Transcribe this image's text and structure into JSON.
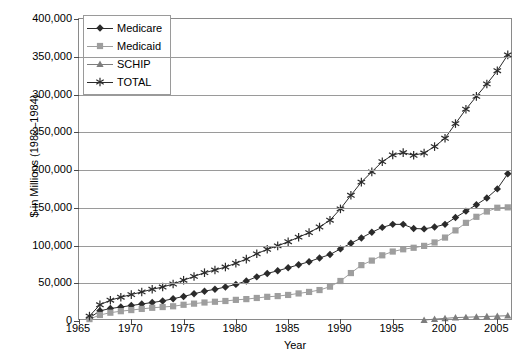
{
  "chart_data": {
    "type": "line",
    "title": "",
    "xlabel": "Year",
    "ylabel": "$ in Millions (1982–1984)",
    "xlim": [
      1965,
      2006.5
    ],
    "ylim": [
      0,
      400000
    ],
    "xticks": [
      1965,
      1970,
      1975,
      1980,
      1985,
      1990,
      1995,
      2000,
      2005
    ],
    "xtick_labels": [
      "1965",
      "1970",
      "1975",
      "1980",
      "1985",
      "1990",
      "1995",
      "2000",
      "2005"
    ],
    "yticks": [
      0,
      50000,
      100000,
      150000,
      200000,
      250000,
      300000,
      350000,
      400000
    ],
    "ytick_labels": [
      "0",
      "50,000",
      "100,000",
      "150,000",
      "200,000",
      "250,000",
      "300,000",
      "350,000",
      "400,000"
    ],
    "grid": "horizontal",
    "legend_position": "upper-left-inside",
    "x": [
      1966,
      1967,
      1968,
      1969,
      1970,
      1971,
      1972,
      1973,
      1974,
      1975,
      1976,
      1977,
      1978,
      1979,
      1980,
      1981,
      1982,
      1983,
      1984,
      1985,
      1986,
      1987,
      1988,
      1989,
      1990,
      1991,
      1992,
      1993,
      1994,
      1995,
      1996,
      1997,
      1998,
      1999,
      2000,
      2001,
      2002,
      2003,
      2004,
      2005,
      2006
    ],
    "series": [
      {
        "name": "Medicare",
        "marker": "diamond",
        "color": "#2b2b2b",
        "values": [
          4000,
          13500,
          16500,
          18500,
          20500,
          22500,
          24500,
          26500,
          29500,
          32500,
          36000,
          39500,
          42000,
          45000,
          48500,
          53000,
          58500,
          63000,
          66500,
          70500,
          74500,
          78500,
          83500,
          88000,
          95500,
          103000,
          110000,
          117500,
          124000,
          128000,
          128000,
          122500,
          122000,
          124500,
          128000,
          137000,
          145500,
          154000,
          163000,
          175000,
          195000
        ]
      },
      {
        "name": "Medicaid",
        "marker": "square",
        "color": "#9e9e9e",
        "values": [
          2500,
          8000,
          11000,
          13000,
          14500,
          16000,
          17500,
          18500,
          19500,
          21500,
          23000,
          24500,
          25500,
          26500,
          28000,
          29000,
          30500,
          32000,
          33000,
          34500,
          36500,
          38500,
          41000,
          45500,
          53000,
          63500,
          74000,
          80000,
          87000,
          92000,
          95000,
          97000,
          99500,
          104000,
          110500,
          120000,
          130000,
          138000,
          145000,
          150000,
          150500
        ]
      },
      {
        "name": "SCHIP",
        "marker": "triangle",
        "color": "#7d7d7d",
        "values": [
          null,
          null,
          null,
          null,
          null,
          null,
          null,
          null,
          null,
          null,
          null,
          null,
          null,
          null,
          null,
          null,
          null,
          null,
          null,
          null,
          null,
          null,
          null,
          null,
          null,
          null,
          null,
          null,
          null,
          null,
          null,
          null,
          1200,
          2500,
          3500,
          4500,
          5000,
          5500,
          6000,
          6500,
          7000
        ]
      },
      {
        "name": "TOTAL",
        "marker": "star",
        "color": "#2b2b2b",
        "values": [
          6500,
          21500,
          27500,
          31500,
          35000,
          38500,
          42000,
          45000,
          49000,
          54000,
          59000,
          64000,
          67500,
          71500,
          76500,
          82000,
          89000,
          95000,
          99500,
          105000,
          111000,
          117000,
          124500,
          133500,
          148500,
          166500,
          184000,
          197500,
          211000,
          220000,
          223000,
          219500,
          222500,
          231000,
          242000,
          261500,
          280500,
          297500,
          314000,
          331500,
          352500
        ]
      }
    ]
  },
  "legend": {
    "items": [
      {
        "label": "Medicare",
        "marker": "diamond",
        "color": "#2b2b2b"
      },
      {
        "label": "Medicaid",
        "marker": "square",
        "color": "#9e9e9e"
      },
      {
        "label": "SCHIP",
        "marker": "triangle",
        "color": "#7d7d7d"
      },
      {
        "label": "TOTAL",
        "marker": "star",
        "color": "#2b2b2b"
      }
    ]
  },
  "axes": {
    "y_title": "$ in Millions (1982–1984)",
    "x_title": "Year"
  },
  "colors": {
    "frame": "#8a8a8a",
    "grid": "#9a9a9a",
    "background": "#ffffff",
    "text": "#000000"
  }
}
